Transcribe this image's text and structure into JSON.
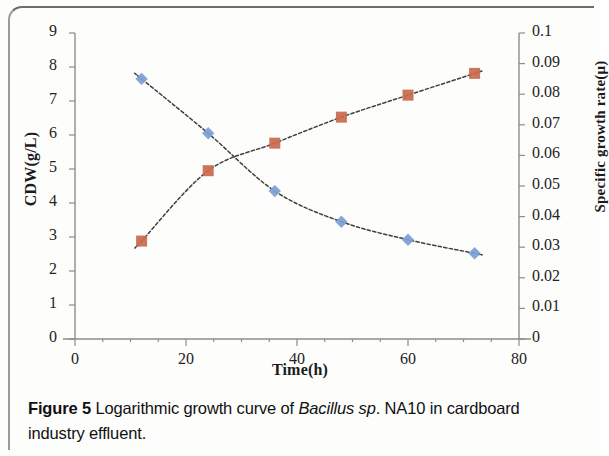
{
  "figure": {
    "caption_label": "Figure 5",
    "caption_text": " Logarithmic growth curve of ",
    "caption_italic": "Bacillus sp",
    "caption_text2": ". NA10 in cardboard industry effluent."
  },
  "chart_data": {
    "type": "line",
    "title": "",
    "xlabel": "Time(h)",
    "ylabel": "CDW(g/L)",
    "ylabel_secondary": "Specific growth rate(μ)",
    "x": [
      12,
      24,
      36,
      48,
      60,
      72
    ],
    "xlim": [
      0,
      80
    ],
    "xticks": [
      0,
      20,
      40,
      60,
      80
    ],
    "xtick_labels": [
      "0",
      "20",
      "40",
      "60",
      "80"
    ],
    "ylim": [
      0,
      9
    ],
    "yticks": [
      0,
      1,
      2,
      3,
      4,
      5,
      6,
      7,
      8,
      9
    ],
    "ytick_labels": [
      "0",
      "1",
      "2",
      "3",
      "4",
      "5",
      "6",
      "7",
      "8",
      "9"
    ],
    "ylim_secondary": [
      0,
      0.1
    ],
    "yticks_secondary": [
      0,
      0.01,
      0.02,
      0.03,
      0.04,
      0.05,
      0.06,
      0.07,
      0.08,
      0.09,
      0.1
    ],
    "ytick_labels_secondary": [
      "0",
      "0.01",
      "0.02",
      "0.03",
      "0.04",
      "0.05",
      "0.06",
      "0.07",
      "0.08",
      "0.09",
      "0.1"
    ],
    "grid": false,
    "legend": "none",
    "series": [
      {
        "name": "CDW(g/L)",
        "axis": "left",
        "marker": "diamond",
        "color": "#7b9fd4",
        "trendline": "polynomial-dashed",
        "values": [
          7.65,
          6.05,
          4.35,
          3.45,
          2.92,
          2.52
        ]
      },
      {
        "name": "Specific growth rate(μ)",
        "axis": "right",
        "marker": "square",
        "color": "#c8694c",
        "trendline": "logarithmic-dashed",
        "values": [
          0.032,
          0.055,
          0.064,
          0.0725,
          0.0797,
          0.0868
        ]
      }
    ]
  },
  "colors": {
    "series_blue": "#7b9fd4",
    "series_orange": "#c8694c",
    "axis": "#808080",
    "trendline": "#3f3f3f"
  }
}
